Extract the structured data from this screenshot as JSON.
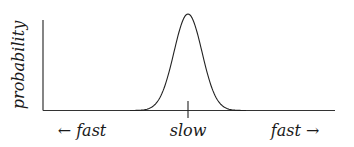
{
  "chart_data": {
    "type": "line",
    "title": "",
    "ylabel": "probability",
    "xlabel": "",
    "x_tick_labels": [
      "← fast",
      "slow",
      "fast →"
    ],
    "x_marker": "slow",
    "curve": "gaussian bell curve centered at 'slow'",
    "grid": false,
    "legend": null
  },
  "labels": {
    "ylabel": "probability",
    "left": "← fast",
    "center": "slow",
    "right": "fast →"
  },
  "colors": {
    "line": "#1a1a1a",
    "background": "#ffffff"
  }
}
